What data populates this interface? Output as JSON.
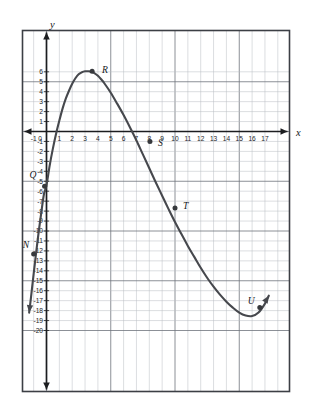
{
  "chart_data": {
    "type": "line",
    "title": "",
    "xlabel": "x",
    "ylabel": "y",
    "xlim": [
      -2.6,
      18.1
    ],
    "ylim": [
      -20.8,
      6.9
    ],
    "grid": true,
    "grid_step": 1,
    "legend": "none",
    "x_ticks": [
      -2,
      -1,
      0,
      1,
      2,
      3,
      4,
      5,
      6,
      7,
      8,
      9,
      10,
      11,
      12,
      13,
      14,
      15,
      16,
      17
    ],
    "y_ticks": [
      6,
      5,
      4,
      3,
      2,
      1,
      -1,
      -2,
      -3,
      -4,
      -5,
      -6,
      -7,
      -8,
      -9,
      -10,
      -11,
      -12,
      -13,
      -14,
      -15,
      -16,
      -17,
      -18,
      -19,
      -20
    ],
    "x_tick_labels": [
      "-2",
      "-1",
      "0",
      "1",
      "2",
      "3",
      "4",
      "5",
      "6",
      "7",
      "8",
      "9",
      "10",
      "11",
      "12",
      "13",
      "14",
      "15",
      "16",
      "17"
    ],
    "y_tick_labels": [
      "6",
      "5",
      "4",
      "3",
      "2",
      "1",
      "-1",
      "-2",
      "-3",
      "-4",
      "-5",
      "-6",
      "-7",
      "-8",
      "-9",
      "-10",
      "-11",
      "-12",
      "-13",
      "-14",
      "-15",
      "-16",
      "-17",
      "-18",
      "-19",
      "-20"
    ],
    "origin_label": "0",
    "series": [
      {
        "name": "cubic-curve",
        "color": "#46484d",
        "arrow_start": true,
        "arrow_end": true,
        "x": [
          -1.35,
          -1.2,
          -1.0,
          -0.8,
          -0.6,
          -0.4,
          -0.2,
          0.0,
          0.25,
          0.5,
          0.75,
          1.0,
          1.25,
          1.5,
          1.75,
          2.0,
          2.25,
          2.5,
          2.75,
          3.0,
          3.25,
          3.5,
          3.75,
          4.0,
          4.25,
          4.5,
          5.0,
          5.5,
          6.0,
          6.5,
          7.0,
          7.5,
          8.0,
          8.5,
          9.0,
          9.5,
          10.0,
          10.5,
          11.0,
          11.5,
          12.0,
          12.5,
          13.0,
          13.5,
          14.0,
          14.5,
          15.0,
          15.5,
          16.0,
          16.5,
          17.0,
          17.3
        ],
        "y": [
          -18.2,
          -16.6,
          -14.3,
          -12.1,
          -10.0,
          -8.1,
          -6.3,
          -5.4,
          -3.4,
          -1.7,
          -0.2,
          1.1,
          2.3,
          3.3,
          4.1,
          4.8,
          5.35,
          5.75,
          5.95,
          6.05,
          6.05,
          6.0,
          5.85,
          5.6,
          5.25,
          4.85,
          3.9,
          2.8,
          1.65,
          0.4,
          -0.9,
          -2.3,
          -3.7,
          -5.1,
          -6.45,
          -7.8,
          -9.1,
          -10.3,
          -11.5,
          -12.6,
          -13.7,
          -14.7,
          -15.6,
          -16.4,
          -17.1,
          -17.7,
          -18.2,
          -18.5,
          -18.55,
          -18.2,
          -17.3,
          -16.5
        ]
      }
    ],
    "points": [
      {
        "label": "N",
        "x": -1.0,
        "y": -12.3,
        "label_dx": -11,
        "label_dy": -6
      },
      {
        "label": "Q",
        "x": -0.15,
        "y": -5.5,
        "label_dx": -15,
        "label_dy": -8
      },
      {
        "label": "R",
        "x": 3.55,
        "y": 6.05,
        "label_dx": 10,
        "label_dy": 2
      },
      {
        "label": "S",
        "x": 8.05,
        "y": -1.0,
        "label_dx": 8,
        "label_dy": 5
      },
      {
        "label": "T",
        "x": 10.0,
        "y": -7.7,
        "label_dx": 8,
        "label_dy": 1
      },
      {
        "label": "U",
        "x": 16.6,
        "y": -17.7,
        "label_dx": -12,
        "label_dy": -4
      }
    ]
  }
}
